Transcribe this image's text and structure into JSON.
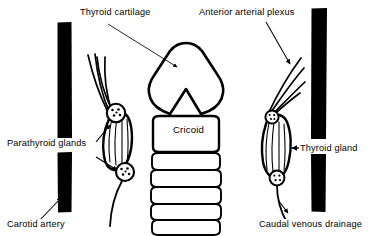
{
  "figure": {
    "type": "anatomical-line-diagram",
    "width": 373,
    "height": 236,
    "background_color": "#ffffff",
    "ink_color": "#000000"
  },
  "labels": {
    "thyroid_cartilage": "Thyroid cartilage",
    "anterior_arterial_plexus": "Anterior arterial plexus",
    "parathyroid_glands": "Parathyroid glands",
    "carotid_artery": "Carotid artery",
    "thyroid_gland": "Thyroid gland",
    "caudal_venous_drainage": "Caudal venous drainage",
    "cricoid": "Cricoid"
  },
  "structures": {
    "thyroid_cartilage": {
      "name": "thyroid-cartilage",
      "description": "rounded triangular shield with inferior V notch",
      "fill": "none",
      "stroke": "#000000"
    },
    "cricoid": {
      "name": "cricoid-cartilage",
      "description": "rounded rectangular band below thyroid cartilage",
      "fill": "none",
      "stroke": "#000000"
    },
    "tracheal_rings": {
      "name": "tracheal-rings",
      "count": 6,
      "fill": "none",
      "stroke": "#000000"
    },
    "carotid_arteries": {
      "name": "carotid-artery-bar",
      "count": 2,
      "fill": "#000000",
      "description": "solid black vertical bars flanking the midline"
    },
    "thyroid_lobes": {
      "name": "thyroid-lobe",
      "count": 2,
      "description": "elongated striated lobes lateral to trachea",
      "fill": "none",
      "stroke": "#000000"
    },
    "parathyroid_glands": {
      "name": "parathyroid-gland",
      "count": 3,
      "description": "small stippled circles at lobe poles",
      "fill": "none",
      "stroke": "#000000"
    }
  },
  "leaders": {
    "thyroid_cartilage": {
      "style": "thin-line-with-solid-triangle-arrowhead",
      "from": "label",
      "to": "thyroid-cartilage-body"
    },
    "anterior_arterial_plexus": {
      "style": "thin-line-with-solid-triangle-arrowhead",
      "from": "label",
      "to": "right-superior-vessels"
    },
    "parathyroid_glands": {
      "style": "two-arrows",
      "from": "label",
      "to": "upper-and-lower-parathyroid"
    },
    "carotid_artery": {
      "style": "thin-line-with-solid-triangle-arrowhead",
      "from": "label",
      "to": "left-carotid-bar"
    },
    "thyroid_gland": {
      "style": "horizontal-arrow-pointing-left",
      "from": "label",
      "to": "right-thyroid-lobe"
    },
    "caudal_venous_drainage": {
      "style": "thin-line-with-solid-triangle-arrowhead",
      "from": "label",
      "to": "right-inferior-vein"
    }
  }
}
